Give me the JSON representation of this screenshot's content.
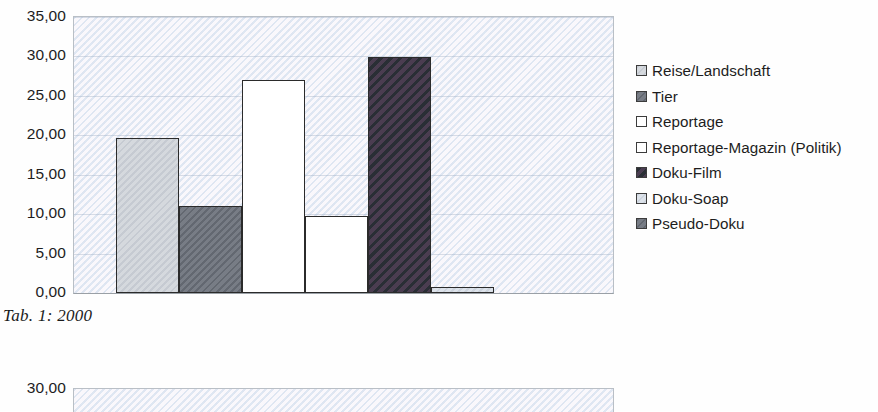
{
  "caption": "Tab. 1: 2000",
  "chart_data": [
    {
      "id": "chart-2000",
      "type": "bar",
      "title": "",
      "xlabel": "",
      "ylabel": "",
      "ylim": [
        0,
        35
      ],
      "yticks": [
        "0,00",
        "5,00",
        "10,00",
        "15,00",
        "20,00",
        "25,00",
        "30,00",
        "35,00"
      ],
      "ytick_values": [
        0,
        5,
        10,
        15,
        20,
        25,
        30,
        35
      ],
      "grid": true,
      "legend_position": "right",
      "categories": [
        "Reise/Landschaft",
        "Tier",
        "Reportage",
        "Reportage-Magazin (Politik)",
        "Doku-Film",
        "Doku-Soap",
        "Pseudo-Doku"
      ],
      "values": [
        19.7,
        11.0,
        27.0,
        9.8,
        29.9,
        0.7,
        0
      ],
      "colors": [
        "#cfd2d6",
        "#6e737b",
        "#ffffff",
        "#ffffff",
        "#3a3040",
        "#d6dbe2",
        "#6e737b"
      ]
    },
    {
      "id": "chart-cropped",
      "type": "bar",
      "title": "",
      "xlabel": "",
      "ylabel": "",
      "ylim": [
        0,
        30
      ],
      "yticks": [
        "30,00"
      ],
      "ytick_values": [
        30
      ],
      "grid": true,
      "categories": [],
      "values": [],
      "note": "cropped at page edge"
    }
  ],
  "legend": {
    "items": [
      {
        "label": "Reise/Landschaft",
        "swatch": "#cfd2d6"
      },
      {
        "label": "Tier",
        "swatch": "#6e737b"
      },
      {
        "label": "Reportage",
        "swatch": "#ffffff"
      },
      {
        "label": "Reportage-Magazin (Politik)",
        "swatch": "#ffffff"
      },
      {
        "label": "Doku-Film",
        "swatch": "#3a3040"
      },
      {
        "label": "Doku-Soap",
        "swatch": "#d6dbe2"
      },
      {
        "label": "Pseudo-Doku",
        "swatch": "#6e737b"
      }
    ]
  }
}
